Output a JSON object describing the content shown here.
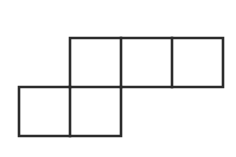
{
  "figure": {
    "name": "pentomino-net-of-five-squares",
    "background_color": "#ffffff",
    "stroke_color": "#2b2b2b",
    "stroke_width": 2.6,
    "fill_color": "#ffffff",
    "canvas": {
      "width": 236,
      "height": 157
    },
    "grid": {
      "cell_width": 51,
      "cell_height": 49,
      "origin_x": 19,
      "origin_y": 38,
      "columns": 4,
      "rows": 2
    },
    "squares": [
      {
        "id": "square-top-1",
        "row": 0,
        "col": 1,
        "x": 70,
        "y": 38,
        "width": 51,
        "height": 49
      },
      {
        "id": "square-top-2",
        "row": 0,
        "col": 2,
        "x": 121,
        "y": 38,
        "width": 51,
        "height": 49
      },
      {
        "id": "square-top-3",
        "row": 0,
        "col": 3,
        "x": 172,
        "y": 38,
        "width": 51,
        "height": 49
      },
      {
        "id": "square-bottom-1",
        "row": 1,
        "col": 0,
        "x": 19,
        "y": 87,
        "width": 51,
        "height": 49
      },
      {
        "id": "square-bottom-2",
        "row": 1,
        "col": 1,
        "x": 70,
        "y": 87,
        "width": 51,
        "height": 49
      }
    ],
    "outline_path": "M 70 38 L 223 38 L 223 87 L 121 87 L 121 136 L 19 136 L 19 87 L 70 87 Z",
    "interior_segments": [
      {
        "id": "divider-top-1",
        "x1": 121,
        "y1": 38,
        "x2": 121,
        "y2": 87
      },
      {
        "id": "divider-top-2",
        "x1": 172,
        "y1": 38,
        "x2": 172,
        "y2": 87
      },
      {
        "id": "divider-bottom-1",
        "x1": 70,
        "y1": 87,
        "x2": 70,
        "y2": 136
      },
      {
        "id": "divider-shared-edge",
        "x1": 70,
        "y1": 87,
        "x2": 121,
        "y2": 87
      }
    ]
  }
}
